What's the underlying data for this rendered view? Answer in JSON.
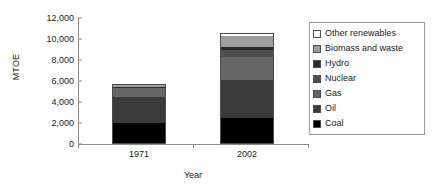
{
  "chart_data": {
    "type": "bar",
    "subtype": "stacked-column",
    "title": "",
    "xlabel": "Year",
    "ylabel": "MTOE",
    "categories": [
      "1971",
      "2002"
    ],
    "ylim": [
      0,
      12000
    ],
    "ytick_values": [
      0,
      2000,
      4000,
      6000,
      8000,
      10000,
      12000
    ],
    "ytick_labels": [
      "0",
      "2,000",
      "4,000",
      "6,000",
      "8,000",
      "10,000",
      "12,000"
    ],
    "grid": false,
    "legend_position": "right",
    "stack_order_bottom_to_top": [
      "Coal",
      "Oil",
      "Gas",
      "Nuclear",
      "Hydro",
      "Biomass and waste",
      "Other renewables"
    ],
    "series": [
      {
        "name": "Coal",
        "color": "#000000",
        "values": [
          1900,
          2400
        ]
      },
      {
        "name": "Oil",
        "color": "#3b3b3b",
        "values": [
          2450,
          3600
        ]
      },
      {
        "name": "Gas",
        "color": "#666666",
        "values": [
          900,
          2200
        ]
      },
      {
        "name": "Nuclear",
        "color": "#4f4f4f",
        "values": [
          30,
          700
        ]
      },
      {
        "name": "Hydro",
        "color": "#2b2b2b",
        "values": [
          100,
          230
        ]
      },
      {
        "name": "Biomass and waste",
        "color": "#9e9e9e",
        "values": [
          120,
          1100
        ]
      },
      {
        "name": "Other renewables",
        "color": "#ffffff",
        "values": [
          0,
          120
        ]
      }
    ],
    "totals": [
      5500,
      10350
    ]
  },
  "legend": {
    "items": [
      {
        "label": "Other renewables",
        "color": "#ffffff"
      },
      {
        "label": "Biomass and waste",
        "color": "#9e9e9e"
      },
      {
        "label": "Hydro",
        "color": "#2b2b2b"
      },
      {
        "label": "Nuclear",
        "color": "#4f4f4f"
      },
      {
        "label": "Gas",
        "color": "#666666"
      },
      {
        "label": "Oil",
        "color": "#3b3b3b"
      },
      {
        "label": "Coal",
        "color": "#000000"
      }
    ]
  }
}
